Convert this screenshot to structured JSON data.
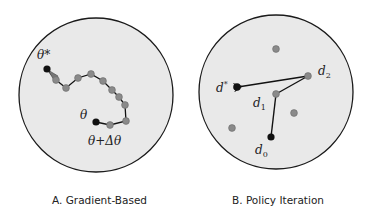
{
  "panels": [
    {
      "id": "A",
      "caption": "A. Gradient-Based",
      "circle": {
        "cx": 96,
        "cy": 95,
        "r": 77
      },
      "labels": {
        "optimum": "θ*",
        "start": "θ",
        "step": "θ+Δθ"
      },
      "path_points": [
        [
          47,
          69
        ],
        [
          56,
          80
        ],
        [
          66,
          88
        ],
        [
          78,
          78
        ],
        [
          91,
          74
        ],
        [
          103,
          81
        ],
        [
          112,
          90
        ],
        [
          119,
          97
        ],
        [
          125,
          105
        ],
        [
          126,
          121
        ],
        [
          110,
          125
        ],
        [
          96,
          122
        ]
      ],
      "optimum_point": [
        47,
        69
      ],
      "start_point": [
        96,
        122
      ]
    },
    {
      "id": "B",
      "caption": "B. Policy Iteration",
      "circle": {
        "cx": 276,
        "cy": 92,
        "r": 77
      },
      "labels": {
        "optimum": "d*",
        "d0": "d0",
        "d1": "d1",
        "d2": "d2"
      },
      "points": {
        "d_star": [
          237,
          87
        ],
        "d0": [
          271,
          137
        ],
        "d1": [
          276,
          94
        ],
        "d2": [
          308,
          76
        ]
      },
      "other_points": [
        [
          276,
          49
        ],
        [
          294,
          113
        ],
        [
          232,
          128
        ]
      ]
    }
  ],
  "colors": {
    "circle_fill": "#e9e9e9",
    "circle_stroke": "#1a1a1a",
    "gray_point": "#8a8a8a",
    "black_point": "#111111",
    "line": "#111111"
  }
}
